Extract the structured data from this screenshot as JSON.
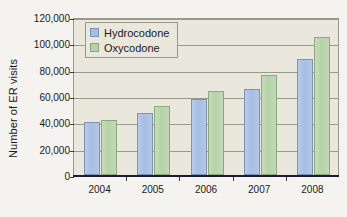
{
  "chart_data": {
    "type": "bar",
    "title": "",
    "subtitle": "",
    "xlabel": "",
    "ylabel": "Number of ER visits",
    "categories": [
      "2004",
      "2005",
      "2006",
      "2007",
      "2008"
    ],
    "series": [
      {
        "name": "Hydrocodone",
        "color": "#a6bee3",
        "values": [
          40000,
          47000,
          57500,
          65000,
          88000
        ]
      },
      {
        "name": "Oxycodone",
        "color": "#b6d2a9",
        "values": [
          42000,
          52500,
          64000,
          76000,
          105000
        ]
      }
    ],
    "ylim": [
      0,
      120000
    ],
    "ytick_values": [
      0,
      20000,
      40000,
      60000,
      80000,
      100000,
      120000
    ],
    "ytick_labels": [
      "0",
      "20,000",
      "40,000",
      "60,000",
      "80,000",
      "100,000",
      "120,000"
    ],
    "grid": true,
    "grid_axis": "y",
    "legend_position": "top-left-inside",
    "plot_background": "#eae8dc",
    "figure_background": "#f4f3ef",
    "axis_color": "#9a988d",
    "baseline_color": "#1c1c2e"
  },
  "legend": {
    "entries": [
      {
        "label": "Hydrocodone"
      },
      {
        "label": "Oxycodone"
      }
    ]
  }
}
